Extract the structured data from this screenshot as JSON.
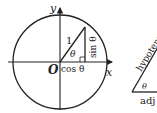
{
  "diagram": {
    "unit_circle": {
      "y_axis_label": "y",
      "x_axis_label": "x",
      "origin_label": "O",
      "hypotenuse_label": "1",
      "angle_label": "θ",
      "opposite_label": "sin θ",
      "adjacent_label": "cos θ"
    },
    "right_triangle": {
      "hypotenuse_label": "hypotenuse",
      "angle_label": "θ",
      "adjacent_label": "adj"
    },
    "colors": {
      "stroke": "#222222",
      "background": "#ffffff"
    }
  }
}
